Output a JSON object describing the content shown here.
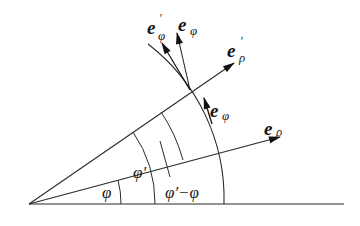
{
  "diagram": {
    "title": "",
    "colors": {
      "stroke": "#2a2a2a",
      "text": "#111111",
      "background": "#ffffff"
    },
    "origin": [
      29,
      204
    ],
    "baseline_end": [
      344,
      204
    ],
    "angle_labels": {
      "phi": "φ",
      "phi_prime": "φ′",
      "difference": "φ′−φ"
    },
    "vectors": [
      {
        "id": "e_rho",
        "base": "e",
        "subscript": "ρ",
        "prime": ""
      },
      {
        "id": "e_phi",
        "base": "e",
        "subscript": "φ",
        "prime": ""
      },
      {
        "id": "e_rho_prime",
        "base": "e",
        "subscript": "ρ",
        "prime": "′"
      },
      {
        "id": "e_phi_prime",
        "base": "e",
        "subscript": "φ",
        "prime": "′"
      },
      {
        "id": "e_phi_top",
        "base": "e",
        "subscript": "φ",
        "prime": ""
      }
    ]
  }
}
